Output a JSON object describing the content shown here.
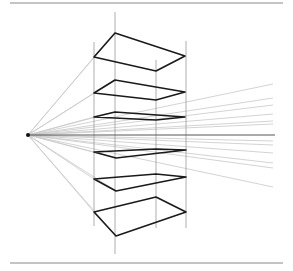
{
  "diagram": {
    "vanishing_point": [
      28,
      135
    ],
    "horizon": {
      "from": [
        28,
        135
      ],
      "to": [
        275,
        135
      ]
    },
    "rules": [
      {
        "y": 3,
        "x1": 10,
        "x2": 283
      },
      {
        "y": 263,
        "x1": 10,
        "x2": 283
      }
    ],
    "verticals": [
      {
        "x": 94,
        "y1": 42,
        "y2": 226
      },
      {
        "x": 115,
        "y1": 12,
        "y2": 254
      },
      {
        "x": 156,
        "y1": 60,
        "y2": 228
      },
      {
        "x": 186,
        "y1": 41,
        "y2": 228
      }
    ],
    "ray_end_x": 273,
    "ray_end_ys": [
      84,
      98,
      105,
      114,
      121,
      124,
      141,
      145,
      153,
      163,
      168,
      187
    ],
    "planes": [
      {
        "points": [
          [
            115,
            33
          ],
          [
            185,
            56
          ],
          [
            156,
            71
          ],
          [
            94,
            57
          ]
        ]
      },
      {
        "points": [
          [
            115,
            80
          ],
          [
            185,
            92
          ],
          [
            156,
            100
          ],
          [
            94,
            93
          ]
        ]
      },
      {
        "points": [
          [
            115,
            112
          ],
          [
            185,
            117
          ],
          [
            156,
            120
          ],
          [
            94,
            117
          ]
        ]
      },
      {
        "points": [
          [
            94,
            152
          ],
          [
            156,
            149
          ],
          [
            186,
            150
          ],
          [
            116,
            158
          ]
        ]
      },
      {
        "points": [
          [
            94,
            179
          ],
          [
            156,
            174
          ],
          [
            186,
            177
          ],
          [
            116,
            191
          ]
        ]
      },
      {
        "points": [
          [
            94,
            212
          ],
          [
            156,
            197
          ],
          [
            186,
            212
          ],
          [
            116,
            236
          ]
        ]
      }
    ],
    "colors": {
      "plane_stroke": "#1a1a1a",
      "ray_stroke": "#c8c8c8",
      "vertical_stroke": "#999999",
      "horizon_stroke": "#555555",
      "rule_stroke": "#8a8a8a"
    }
  }
}
